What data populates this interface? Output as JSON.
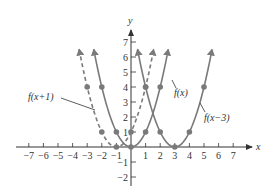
{
  "chart_data": {
    "type": "line",
    "title": "",
    "xlabel": "x",
    "ylabel": "y",
    "xlim": [
      -7,
      7
    ],
    "ylim": [
      -2,
      7
    ],
    "grid": false,
    "x_ticks": [
      -7,
      -6,
      -5,
      -4,
      -3,
      -2,
      -1,
      1,
      2,
      3,
      4,
      5,
      6,
      7
    ],
    "y_ticks": [
      -2,
      -1,
      1,
      2,
      3,
      4,
      5,
      6,
      7
    ],
    "x_tick_labels": [
      "−7",
      "−6",
      "−5",
      "−4",
      "−3",
      "−2",
      "−1",
      "1",
      "2",
      "3",
      "4",
      "5",
      "6",
      "7"
    ],
    "y_tick_labels": [
      "−2",
      "−1",
      "1",
      "2",
      "3",
      "4",
      "5",
      "6",
      "7"
    ],
    "series": [
      {
        "name": "f(x+1)",
        "label": "f(x+1)",
        "equation": "(x+1)^2",
        "style": "dashed",
        "color": "#7a7a7a",
        "shift": -1,
        "points": [
          [
            -3,
            4
          ],
          [
            -2,
            1
          ],
          [
            -1,
            0
          ],
          [
            0,
            1
          ],
          [
            1,
            4
          ]
        ]
      },
      {
        "name": "f(x)",
        "label": "f(x)",
        "equation": "x^2",
        "style": "solid",
        "color": "#7a7a7a",
        "shift": 0,
        "points": [
          [
            -2,
            4
          ],
          [
            -1,
            1
          ],
          [
            0,
            0
          ],
          [
            1,
            1
          ],
          [
            2,
            4
          ]
        ]
      },
      {
        "name": "f(x-3)",
        "label": "f(x−3)",
        "equation": "(x-3)^2",
        "style": "solid",
        "color": "#7a7a7a",
        "shift": 3,
        "points": [
          [
            1,
            4
          ],
          [
            2,
            1
          ],
          [
            3,
            0
          ],
          [
            4,
            1
          ],
          [
            5,
            4
          ]
        ]
      }
    ],
    "annotations": [
      {
        "text": "f(x+1)",
        "points_to": "dashed curve near (-2.5, 2.6)"
      },
      {
        "text": "f(x)",
        "points_to": "solid curve near (2.7, 4.5)"
      },
      {
        "text": "f(x−3)",
        "points_to": "solid curve near (4.6, 2.9)"
      }
    ]
  },
  "axes": {
    "x_label": "x",
    "y_label": "y"
  },
  "labels": {
    "f_x_plus_1": "f(x+1)",
    "f_x": "f(x)",
    "f_x_minus_3": "f(x−3)"
  },
  "colors": {
    "axis": "#333333",
    "curve": "#7a7a7a",
    "point": "#7a7a7a"
  }
}
